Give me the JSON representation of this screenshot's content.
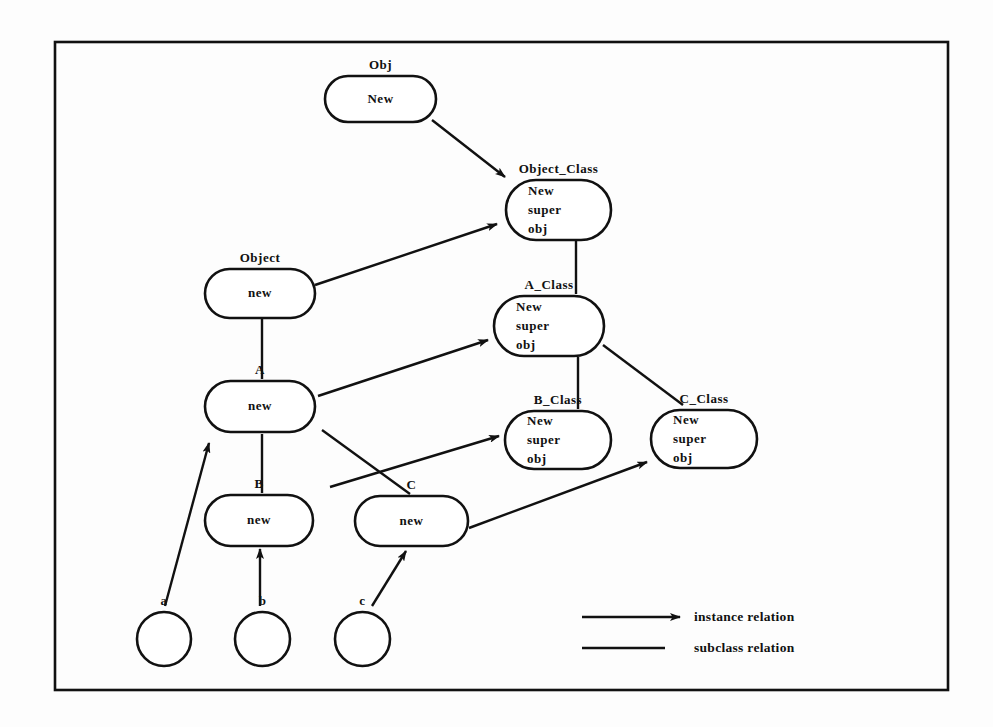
{
  "figure": {
    "frame": {
      "x": 55,
      "y": 42,
      "width": 893,
      "height": 648
    },
    "stroke_color": "#111111",
    "background_color": "#fdfdfd"
  },
  "nodes": [
    {
      "id": "obj",
      "label": "Obj",
      "lines": [
        "New"
      ],
      "shape": "rounded-rect",
      "x": 325,
      "y": 76,
      "width": 111,
      "height": 46
    },
    {
      "id": "object_class",
      "label": "Object_Class",
      "lines": [
        "New",
        "super",
        "obj"
      ],
      "shape": "rounded-rect",
      "x": 506,
      "y": 180,
      "width": 105,
      "height": 60
    },
    {
      "id": "object",
      "label": "Object",
      "lines": [
        "new"
      ],
      "shape": "rounded-rect",
      "x": 205,
      "y": 269,
      "width": 110,
      "height": 49
    },
    {
      "id": "a_class",
      "label": "A_Class",
      "lines": [
        "New",
        "super",
        "obj"
      ],
      "shape": "rounded-rect",
      "x": 494,
      "y": 296,
      "width": 110,
      "height": 60
    },
    {
      "id": "a",
      "label": "A",
      "lines": [
        "new"
      ],
      "shape": "rounded-rect",
      "x": 205,
      "y": 381,
      "width": 110,
      "height": 51
    },
    {
      "id": "b_class",
      "label": "B_Class",
      "lines": [
        "New",
        "super",
        "obj"
      ],
      "shape": "rounded-rect",
      "x": 505,
      "y": 411,
      "width": 106,
      "height": 58
    },
    {
      "id": "c_class",
      "label": "C_Class",
      "lines": [
        "New",
        "super",
        "obj"
      ],
      "shape": "rounded-rect",
      "x": 651,
      "y": 410,
      "width": 106,
      "height": 58
    },
    {
      "id": "b",
      "label": "B",
      "lines": [
        "new"
      ],
      "shape": "rounded-rect",
      "x": 205,
      "y": 495,
      "width": 108,
      "height": 51
    },
    {
      "id": "c",
      "label": "C",
      "lines": [
        "new"
      ],
      "shape": "rounded-rect",
      "x": 355,
      "y": 496,
      "width": 113,
      "height": 50
    },
    {
      "id": "inst_a",
      "label": "a",
      "lines": [],
      "shape": "circle",
      "x": 137,
      "y": 612,
      "width": 54,
      "height": 54
    },
    {
      "id": "inst_b",
      "label": "b",
      "lines": [],
      "shape": "circle",
      "x": 235,
      "y": 612,
      "width": 55,
      "height": 54
    },
    {
      "id": "inst_c",
      "label": "c",
      "lines": [],
      "shape": "circle",
      "x": 335,
      "y": 612,
      "width": 55,
      "height": 54
    }
  ],
  "edges": [
    {
      "id": "obj-to-object_class",
      "relation": "instance",
      "from": "obj",
      "to": "object_class",
      "x1": 432,
      "y1": 120,
      "x2": 505,
      "y2": 177
    },
    {
      "id": "object-to-object_class",
      "relation": "instance",
      "from": "object",
      "to": "object_class",
      "x1": 315,
      "y1": 285,
      "x2": 497,
      "y2": 224
    },
    {
      "id": "a-to-a_class",
      "relation": "instance",
      "from": "a",
      "to": "a_class",
      "x1": 318,
      "y1": 396,
      "x2": 488,
      "y2": 340
    },
    {
      "id": "a-to-b_class",
      "relation": "instance",
      "from": "a",
      "to": "b_class",
      "x1": 330,
      "y1": 487,
      "x2": 499,
      "y2": 436
    },
    {
      "id": "c-to-c_class",
      "relation": "instance",
      "from": "c",
      "to": "c_class",
      "x1": 469,
      "y1": 528,
      "x2": 647,
      "y2": 462
    },
    {
      "id": "inst_a-to-a",
      "relation": "instance",
      "from": "inst_a",
      "to": "a",
      "x1": 165,
      "y1": 606,
      "x2": 209,
      "y2": 443
    },
    {
      "id": "inst_b-to-b",
      "relation": "instance",
      "from": "inst_b",
      "to": "b",
      "x1": 260,
      "y1": 606,
      "x2": 260,
      "y2": 549
    },
    {
      "id": "inst_c-to-c",
      "relation": "instance",
      "from": "inst_c",
      "to": "c",
      "x1": 372,
      "y1": 606,
      "x2": 406,
      "y2": 551
    },
    {
      "id": "object_class-to-a_class",
      "relation": "subclass",
      "from": "object_class",
      "to": "a_class",
      "x1": 576,
      "y1": 240,
      "x2": 576,
      "y2": 294
    },
    {
      "id": "a_class-to-b_class",
      "relation": "subclass",
      "from": "a_class",
      "to": "b_class",
      "x1": 578,
      "y1": 357,
      "x2": 578,
      "y2": 409
    },
    {
      "id": "a_class-to-c_class",
      "relation": "subclass",
      "from": "a_class",
      "to": "c_class",
      "x1": 603,
      "y1": 345,
      "x2": 683,
      "y2": 405
    },
    {
      "id": "object-to-a",
      "relation": "subclass",
      "from": "object",
      "to": "a",
      "x1": 262,
      "y1": 319,
      "x2": 262,
      "y2": 379
    },
    {
      "id": "a-to-b",
      "relation": "subclass",
      "from": "a",
      "to": "b",
      "x1": 262,
      "y1": 434,
      "x2": 262,
      "y2": 493
    },
    {
      "id": "a-to-c",
      "relation": "subclass",
      "from": "a",
      "to": "c",
      "x1": 322,
      "y1": 430,
      "x2": 410,
      "y2": 494
    }
  ],
  "legend": {
    "items": [
      {
        "id": "legend-instance",
        "label": "instance relation",
        "marker": "arrow",
        "x1": 582,
        "y1": 617,
        "x2": 680,
        "y2": 617,
        "text_x": 694,
        "text_y": 609
      },
      {
        "id": "legend-subclass",
        "label": "subclass relation",
        "marker": "line",
        "x1": 582,
        "y1": 648,
        "x2": 665,
        "y2": 648,
        "text_x": 694,
        "text_y": 640
      }
    ]
  }
}
